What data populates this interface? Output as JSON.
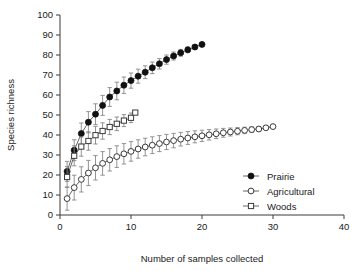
{
  "chart_data": {
    "type": "line",
    "title": "",
    "subtitle": "",
    "xlabel": "Number of samples collected",
    "ylabel": "Species richness",
    "xlim": [
      0,
      40
    ],
    "ylim": [
      0,
      100
    ],
    "xticks": [
      0,
      10,
      20,
      30,
      40
    ],
    "yticks": [
      0,
      10,
      20,
      30,
      40,
      50,
      60,
      70,
      80,
      90,
      100
    ],
    "xtick_labels": [
      "0",
      "10",
      "20",
      "30",
      "40"
    ],
    "ytick_labels": [
      "0",
      "10",
      "20",
      "30",
      "40",
      "50",
      "60",
      "70",
      "80",
      "90",
      "100"
    ],
    "grid": false,
    "legend_position": "lower-right",
    "error_bars": "vertical, symmetric (standard deviation)",
    "series": [
      {
        "name": "Prairie",
        "marker": "filled-circle",
        "color": "#1a1a1a",
        "x": [
          1,
          2,
          3,
          4,
          5,
          6,
          7,
          8,
          9,
          10,
          11,
          12,
          13,
          14,
          15,
          16,
          17,
          18,
          19,
          20
        ],
        "values": [
          21.8,
          32.4,
          40.7,
          46.4,
          50.4,
          54.8,
          59.0,
          62.0,
          64.9,
          67.2,
          69.4,
          71.4,
          73.6,
          75.6,
          77.7,
          79.5,
          81.1,
          82.6,
          84.0,
          85.3
        ],
        "error": [
          5.0,
          5.2,
          5.3,
          5.3,
          5.2,
          5.0,
          4.7,
          4.4,
          4.1,
          3.8,
          3.5,
          3.2,
          2.9,
          2.6,
          2.3,
          2.0,
          1.7,
          1.4,
          1.1,
          0.6
        ]
      },
      {
        "name": "Agricultural",
        "marker": "open-circle",
        "color": "#1a1a1a",
        "x": [
          1,
          2,
          3,
          4,
          5,
          6,
          7,
          8,
          9,
          10,
          11,
          12,
          13,
          14,
          15,
          16,
          17,
          18,
          19,
          20,
          21,
          22,
          23,
          24,
          25,
          26,
          27,
          28,
          29,
          30
        ],
        "values": [
          8.2,
          13.7,
          17.8,
          21.0,
          23.6,
          25.8,
          27.6,
          29.2,
          30.6,
          31.8,
          33.0,
          34.0,
          34.9,
          35.7,
          36.5,
          37.2,
          37.9,
          38.5,
          39.1,
          39.6,
          40.1,
          40.6,
          41.1,
          41.5,
          41.9,
          42.3,
          42.7,
          43.0,
          43.6,
          44.2
        ],
        "error": [
          5.8,
          6.2,
          6.3,
          6.3,
          6.1,
          5.9,
          5.6,
          5.4,
          5.1,
          4.9,
          4.6,
          4.4,
          4.2,
          4.0,
          3.8,
          3.6,
          3.4,
          3.2,
          3.0,
          2.8,
          2.6,
          2.4,
          2.2,
          2.0,
          1.8,
          1.6,
          1.4,
          1.2,
          0.8,
          0.4
        ]
      },
      {
        "name": "Woods",
        "marker": "open-square",
        "color": "#1a1a1a",
        "x": [
          1,
          2,
          3,
          4,
          5,
          6,
          7,
          8,
          9,
          10,
          10.6
        ],
        "values": [
          19.0,
          29.6,
          34.2,
          37.0,
          39.9,
          42.0,
          44.0,
          45.6,
          47.2,
          48.6,
          51.2
        ],
        "error": [
          5.2,
          5.0,
          4.8,
          4.6,
          4.4,
          4.1,
          3.8,
          3.4,
          3.0,
          2.4,
          0.5
        ]
      }
    ],
    "legend": [
      {
        "label": "Prairie",
        "marker": "filled-circle"
      },
      {
        "label": "Agricultural",
        "marker": "open-circle"
      },
      {
        "label": "Woods",
        "marker": "open-square"
      }
    ]
  },
  "colors": {
    "axis": "#3a3a3a",
    "marker_fill_dark": "#111111",
    "marker_fill_open": "#ffffff",
    "line": "#555555",
    "error_bar": "#888888",
    "background": "#ffffff"
  }
}
